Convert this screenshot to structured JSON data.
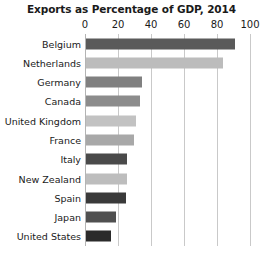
{
  "chart_data": {
    "type": "bar",
    "orientation": "horizontal",
    "title": "Exports as Percentage of GDP, 2014",
    "xlabel": "",
    "ylabel": "",
    "xlim": [
      0,
      100
    ],
    "xticks": [
      0,
      20,
      40,
      60,
      80,
      100
    ],
    "xtick_labels": [
      "0",
      "20",
      "40",
      "60",
      "80",
      "100"
    ],
    "grid": true,
    "legend": "none",
    "categories": [
      "Belgium",
      "Netherlands",
      "Germany",
      "Canada",
      "United Kingdom",
      "France",
      "Italy",
      "New Zealand",
      "Spain",
      "Japan",
      "United States"
    ],
    "values": [
      90,
      83,
      34,
      33,
      30,
      29,
      25,
      25,
      24,
      18,
      15
    ],
    "bar_colors": [
      "#5a5a5a",
      "#bcbcbc",
      "#808080",
      "#8c8c8c",
      "#c2c2c2",
      "#a8a8a8",
      "#4a4a4a",
      "#bdbdbd",
      "#3a3a3a",
      "#505050",
      "#2b2b2b"
    ],
    "background_color": "#ffffff",
    "grid_color": "#c9c9c9"
  }
}
